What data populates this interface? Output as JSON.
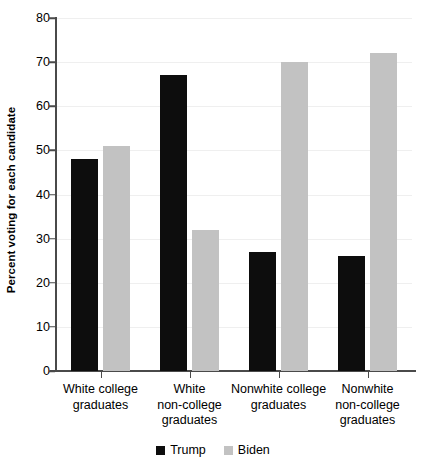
{
  "chart_data": {
    "type": "bar",
    "title": "",
    "subtitle": "",
    "xlabel": "",
    "ylabel": "Percent voting for each candidate",
    "ylim": [
      0,
      80
    ],
    "yticks": [
      0,
      10,
      20,
      30,
      40,
      50,
      60,
      70,
      80
    ],
    "ytick_labels": [
      "0",
      "10",
      "20",
      "30",
      "40",
      "50",
      "60",
      "70",
      "80"
    ],
    "grid": true,
    "grid_axis": "y",
    "legend_position": "bottom-center",
    "categories": [
      "White college graduates",
      "White non-college graduates",
      "Nonwhite college graduates",
      "Nonwhite non-college graduates"
    ],
    "category_label_lines": [
      [
        "White college",
        "graduates"
      ],
      [
        "White",
        "non-college",
        "graduates"
      ],
      [
        "Nonwhite college",
        "graduates"
      ],
      [
        "Nonwhite",
        "non-college",
        "graduates"
      ]
    ],
    "series": [
      {
        "name": "Trump",
        "color": "#0d0d0d",
        "values": [
          48,
          67,
          27,
          26
        ]
      },
      {
        "name": "Biden",
        "color": "#c2c2c2",
        "values": [
          51,
          32,
          70,
          72
        ]
      }
    ]
  },
  "legend": {
    "entries": [
      {
        "label": "Trump",
        "color": "#0d0d0d"
      },
      {
        "label": "Biden",
        "color": "#c2c2c2"
      }
    ]
  },
  "axes": {
    "y_title": "Percent voting for each candidate"
  },
  "colors": {
    "trump": "#0d0d0d",
    "biden": "#c2c2c2",
    "axis": "#4a4a4a",
    "gridline": "#efefef",
    "background": "#ffffff"
  }
}
